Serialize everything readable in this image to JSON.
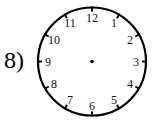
{
  "problem": {
    "label": "8)"
  },
  "clock": {
    "numbers": [
      "12",
      "1",
      "2",
      "3",
      "4",
      "5",
      "6",
      "7",
      "8",
      "9",
      "10",
      "11"
    ],
    "hands": "none",
    "colors": {
      "face": "#ffffff",
      "outline": "#000000"
    }
  }
}
